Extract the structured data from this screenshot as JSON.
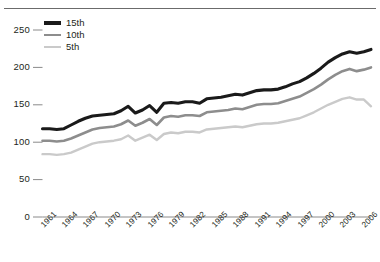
{
  "chart_data": {
    "type": "line",
    "title": "",
    "subtitle": "",
    "xlabel": "",
    "ylabel": "",
    "xlim": [
      1961,
      2007
    ],
    "ylim": [
      0,
      262
    ],
    "grid": false,
    "legend_position": "top-left",
    "y_ticks": [
      0,
      50,
      100,
      150,
      200,
      250
    ],
    "x_tick_labels": [
      "1961",
      "1964",
      "1967",
      "1970",
      "1973",
      "1976",
      "1979",
      "1982",
      "1985",
      "1988",
      "1991",
      "1994",
      "1997",
      "2000",
      "2003",
      "2006"
    ],
    "x": [
      1961,
      1962,
      1963,
      1964,
      1965,
      1966,
      1967,
      1968,
      1969,
      1970,
      1971,
      1972,
      1973,
      1974,
      1975,
      1976,
      1977,
      1978,
      1979,
      1980,
      1981,
      1982,
      1983,
      1984,
      1985,
      1986,
      1987,
      1988,
      1989,
      1990,
      1991,
      1992,
      1993,
      1994,
      1995,
      1996,
      1997,
      1998,
      1999,
      2000,
      2001,
      2002,
      2003,
      2004,
      2005,
      2006,
      2007
    ],
    "series": [
      {
        "name": "15th",
        "color": "#1a1a1a",
        "width": 3.1,
        "values": [
          118,
          118,
          117,
          118,
          123,
          128,
          132,
          135,
          136,
          137,
          138,
          142,
          148,
          139,
          143,
          149,
          140,
          152,
          153,
          152,
          154,
          154,
          152,
          158,
          159,
          160,
          162,
          164,
          163,
          166,
          169,
          170,
          170,
          171,
          174,
          178,
          181,
          186,
          192,
          199,
          207,
          213,
          218,
          221,
          219,
          221,
          224
        ]
      },
      {
        "name": "10th",
        "color": "#8d8d8d",
        "width": 2.6,
        "values": [
          102,
          102,
          101,
          102,
          105,
          109,
          113,
          117,
          119,
          120,
          121,
          124,
          129,
          122,
          126,
          131,
          123,
          133,
          135,
          134,
          136,
          136,
          135,
          140,
          141,
          142,
          143,
          145,
          144,
          147,
          150,
          151,
          151,
          152,
          155,
          158,
          161,
          166,
          171,
          177,
          184,
          190,
          195,
          198,
          195,
          197,
          200
        ]
      },
      {
        "name": "5th",
        "color": "#cacaca",
        "width": 2.4,
        "values": [
          84,
          84,
          83,
          84,
          86,
          90,
          94,
          98,
          100,
          101,
          102,
          104,
          109,
          102,
          106,
          110,
          103,
          111,
          113,
          112,
          114,
          114,
          113,
          117,
          118,
          119,
          120,
          121,
          120,
          122,
          124,
          125,
          125,
          126,
          128,
          130,
          132,
          136,
          140,
          145,
          150,
          154,
          158,
          160,
          157,
          157,
          148
        ]
      }
    ]
  }
}
